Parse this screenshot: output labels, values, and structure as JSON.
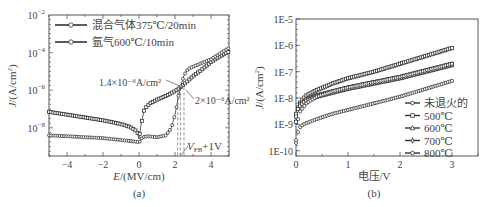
{
  "figure": {
    "panels": [
      "(a)",
      "(b)"
    ]
  },
  "chart_data": [
    {
      "type": "line",
      "panel": "(a)",
      "xlabel": "E/(MV/cm)",
      "ylabel": "J/(A/cm²)",
      "xlim": [
        -5,
        5
      ],
      "ylim_log10": [
        -9.5,
        -2
      ],
      "yscale": "log",
      "xticks": [
        -4,
        -2,
        0,
        2,
        4
      ],
      "yticks": [
        "10⁻²",
        "10⁻⁴",
        "10⁻⁶",
        "10⁻⁸"
      ],
      "ytick_exponents": [
        -2,
        -4,
        -6,
        -8
      ],
      "legend": [
        "混合气体375℃/20min",
        "氩气600℃/10min"
      ],
      "legend_position": "upper left",
      "annotations": [
        "1.4×10⁻⁶A/cm²",
        "2×10⁻⁶A/cm²",
        "V_FB+1V"
      ],
      "vlines_x": [
        2.15,
        2.3,
        2.5
      ],
      "series": [
        {
          "name": "混合气体375℃/20min",
          "marker": "circle",
          "x": [
            -5,
            -4,
            -3,
            -2,
            -1,
            -0.5,
            -0.1,
            0,
            0.1,
            0.3,
            0.6,
            1.0,
            1.5,
            2.0,
            2.3,
            2.6,
            3.0,
            3.5,
            4.0,
            4.5,
            5.0
          ],
          "log10y": [
            -7.15,
            -7.3,
            -7.45,
            -7.6,
            -7.8,
            -7.95,
            -8.2,
            -8.6,
            -7.9,
            -7.0,
            -6.7,
            -6.5,
            -6.3,
            -6.05,
            -5.85,
            -5.6,
            -5.25,
            -4.9,
            -4.5,
            -4.2,
            -3.95
          ]
        },
        {
          "name": "氩气600℃/10min",
          "marker": "square",
          "x": [
            -5,
            -4,
            -3,
            -2,
            -1,
            -0.5,
            -0.1,
            0,
            0.2,
            0.5,
            1.0,
            1.5,
            1.8,
            2.0,
            2.2,
            2.3,
            2.5,
            2.7,
            3.0,
            3.5,
            4.0,
            4.5,
            5.0
          ],
          "log10y": [
            -8.4,
            -8.45,
            -8.5,
            -8.55,
            -8.65,
            -8.7,
            -8.75,
            -8.8,
            -8.5,
            -8.45,
            -8.5,
            -8.4,
            -8.0,
            -7.3,
            -6.3,
            -5.85,
            -5.2,
            -4.9,
            -4.75,
            -4.55,
            -4.35,
            -4.05,
            -3.75
          ]
        }
      ]
    },
    {
      "type": "line",
      "panel": "(b)",
      "xlabel": "电压/V",
      "ylabel": "J/(A/cm²)",
      "xlim": [
        0,
        3.5
      ],
      "ylim_log10": [
        -10.3,
        -5
      ],
      "yscale": "log",
      "xticks": [
        0,
        1,
        2,
        3
      ],
      "yticks": [
        "1E-5",
        "1E-6",
        "1E-7",
        "1E-8",
        "1E-9",
        "1E-10"
      ],
      "ytick_exponents": [
        -5,
        -6,
        -7,
        -8,
        -9,
        -10
      ],
      "legend": [
        "未退火的",
        "500℃",
        "600℃",
        "700℃",
        "800℃"
      ],
      "legend_position": "lower right",
      "series": [
        {
          "name": "未退火的",
          "marker": "circle",
          "x": [
            0,
            0.05,
            0.1,
            0.2,
            0.4,
            0.7,
            1.0,
            1.5,
            2.0,
            2.5,
            3.0
          ],
          "log10y": [
            -9.7,
            -9.2,
            -9.05,
            -8.95,
            -8.8,
            -8.6,
            -8.45,
            -8.2,
            -7.95,
            -7.65,
            -7.35
          ]
        },
        {
          "name": "500℃",
          "marker": "square",
          "x": [
            0,
            0.05,
            0.1,
            0.2,
            0.4,
            0.7,
            1.0,
            1.5,
            2.0,
            2.5,
            3.0
          ],
          "log10y": [
            -8.9,
            -8.3,
            -8.1,
            -7.9,
            -7.7,
            -7.45,
            -7.25,
            -7.0,
            -6.7,
            -6.4,
            -6.1
          ]
        },
        {
          "name": "600℃",
          "marker": "triangle",
          "x": [
            0,
            0.05,
            0.1,
            0.2,
            0.4,
            0.7,
            1.0,
            1.5,
            2.0,
            2.5,
            3.0
          ],
          "log10y": [
            -8.6,
            -8.3,
            -8.2,
            -8.05,
            -7.9,
            -7.75,
            -7.6,
            -7.4,
            -7.2,
            -6.95,
            -6.7
          ]
        },
        {
          "name": "700℃",
          "marker": "star",
          "x": [
            0,
            0.05,
            0.1,
            0.2,
            0.4,
            0.7,
            1.0,
            1.5,
            2.0,
            2.5,
            3.0
          ],
          "log10y": [
            -8.7,
            -8.35,
            -8.25,
            -8.1,
            -7.95,
            -7.8,
            -7.65,
            -7.45,
            -7.25,
            -7.0,
            -6.75
          ]
        },
        {
          "name": "800℃",
          "marker": "circle",
          "x": [
            0,
            0.05,
            0.1,
            0.2,
            0.4,
            0.7,
            1.0,
            1.5,
            2.0,
            2.5,
            3.0
          ],
          "log10y": [
            -9.6,
            -8.6,
            -8.45,
            -8.2,
            -7.95,
            -7.75,
            -7.6,
            -7.4,
            -7.2,
            -6.95,
            -6.7
          ]
        }
      ]
    }
  ]
}
